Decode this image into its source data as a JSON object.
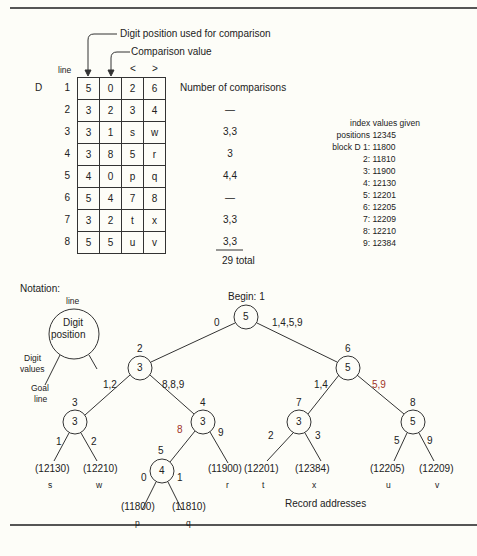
{
  "figure": {
    "callouts": {
      "digit_position": "Digit position used for comparison",
      "comparison_value": "Comparison value"
    },
    "table": {
      "line_header": "line",
      "lt_header": "<",
      "gt_header": ">",
      "block_label": "D",
      "rows": [
        {
          "line": "1",
          "pos": "5",
          "val": "0",
          "lt": "2",
          "gt": "6"
        },
        {
          "line": "2",
          "pos": "3",
          "val": "2",
          "lt": "3",
          "gt": "4"
        },
        {
          "line": "3",
          "pos": "3",
          "val": "1",
          "lt": "s",
          "gt": "w"
        },
        {
          "line": "4",
          "pos": "3",
          "val": "8",
          "lt": "5",
          "gt": "r"
        },
        {
          "line": "5",
          "pos": "4",
          "val": "0",
          "lt": "p",
          "gt": "q"
        },
        {
          "line": "6",
          "pos": "5",
          "val": "4",
          "lt": "7",
          "gt": "8"
        },
        {
          "line": "7",
          "pos": "3",
          "val": "2",
          "lt": "t",
          "gt": "x"
        },
        {
          "line": "8",
          "pos": "5",
          "val": "5",
          "lt": "u",
          "gt": "v"
        }
      ]
    },
    "comparisons": {
      "header": "Number of comparisons",
      "values": [
        "—",
        "3,3",
        "3",
        "4,4",
        "—",
        "3,3",
        "3,3"
      ],
      "total": "29 total"
    },
    "index_values": {
      "title": "index values given",
      "positions_label": "positions",
      "positions_value": "12345",
      "entries": [
        {
          "key": "block D 1:",
          "value": "11800"
        },
        {
          "key": "2:",
          "value": "11810"
        },
        {
          "key": "3:",
          "value": "11900"
        },
        {
          "key": "4:",
          "value": "12130"
        },
        {
          "key": "5:",
          "value": "12201"
        },
        {
          "key": "6:",
          "value": "12205"
        },
        {
          "key": "7:",
          "value": "12209"
        },
        {
          "key": "8:",
          "value": "12210"
        },
        {
          "key": "9:",
          "value": "12384"
        }
      ]
    },
    "notation": {
      "title": "Notation:",
      "line": "line",
      "digit": "Digit",
      "position": "position",
      "digit_values_1": "Digit",
      "digit_values_2": "values",
      "goal_1": "Goal",
      "goal_2": "line"
    },
    "tree": {
      "begin_label": "Begin: 1",
      "nodes": {
        "n1": {
          "line": "",
          "digit": "5"
        },
        "n2": {
          "line": "2",
          "digit": "3"
        },
        "n6": {
          "line": "6",
          "digit": "5"
        },
        "n3": {
          "line": "3",
          "digit": "3"
        },
        "n4": {
          "line": "4",
          "digit": "3"
        },
        "n7": {
          "line": "7",
          "digit": "3"
        },
        "n8": {
          "line": "8",
          "digit": "5"
        },
        "n5": {
          "line": "5",
          "digit": "4"
        }
      },
      "edges": {
        "n1_left": "0",
        "n1_right": "1,4,5,9",
        "n2_left": "1,2",
        "n2_right": "8,8,9",
        "n6_left": "1,4",
        "n6_right": "5,9",
        "n3_left": "1",
        "n3_right": "2",
        "n4_left": "8",
        "n4_right": "9",
        "n7_left": "2",
        "n7_right": "3",
        "n8_left": "5",
        "n8_right": "9",
        "n5_left": "0",
        "n5_right": "1"
      },
      "leaves": [
        {
          "addr": "(12130)",
          "rec": "s"
        },
        {
          "addr": "(12210)",
          "rec": "w"
        },
        {
          "addr": "(11800)",
          "rec": "p"
        },
        {
          "addr": "(11810)",
          "rec": "q"
        },
        {
          "addr": "(11900)",
          "rec": "r"
        },
        {
          "addr": "(12201)",
          "rec": "t"
        },
        {
          "addr": "(12384)",
          "rec": "x"
        },
        {
          "addr": "(12205)",
          "rec": "u"
        },
        {
          "addr": "(12209)",
          "rec": "v"
        }
      ],
      "record_addresses_label": "Record addresses"
    },
    "colors": {
      "ink": "#222222",
      "accent_red": "#a03428",
      "paper": "#fdfdf8"
    }
  }
}
